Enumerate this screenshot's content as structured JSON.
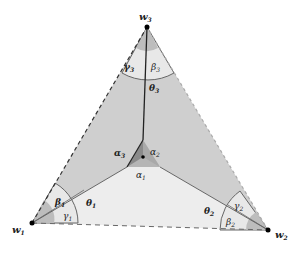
{
  "vertices": {
    "w1": {
      "label": "w",
      "sub": "1"
    },
    "w2": {
      "label": "w",
      "sub": "2"
    },
    "w3": {
      "label": "w",
      "sub": "3"
    }
  },
  "angles": {
    "alpha1": {
      "label": "α",
      "sub": "1"
    },
    "alpha2": {
      "label": "α",
      "sub": "2"
    },
    "alpha3": {
      "label": "α",
      "sub": "3"
    },
    "beta1": {
      "label": "β",
      "sub": "1"
    },
    "beta2": {
      "label": "β",
      "sub": "2"
    },
    "beta3": {
      "label": "β",
      "sub": "3"
    },
    "gamma1": {
      "label": "γ",
      "sub": "1"
    },
    "gamma2": {
      "label": "γ",
      "sub": "2"
    },
    "gamma3": {
      "label": "γ",
      "sub": "3"
    },
    "theta1": {
      "label": "θ",
      "sub": "1"
    },
    "theta2": {
      "label": "θ",
      "sub": "2"
    },
    "theta3": {
      "label": "θ",
      "sub": "3"
    }
  },
  "colors": {
    "dark_region": "#c9c9c9",
    "light_region": "#ececec",
    "sector_fill": "#e6e6e6",
    "line": "#555555",
    "dashed": "#444444"
  }
}
